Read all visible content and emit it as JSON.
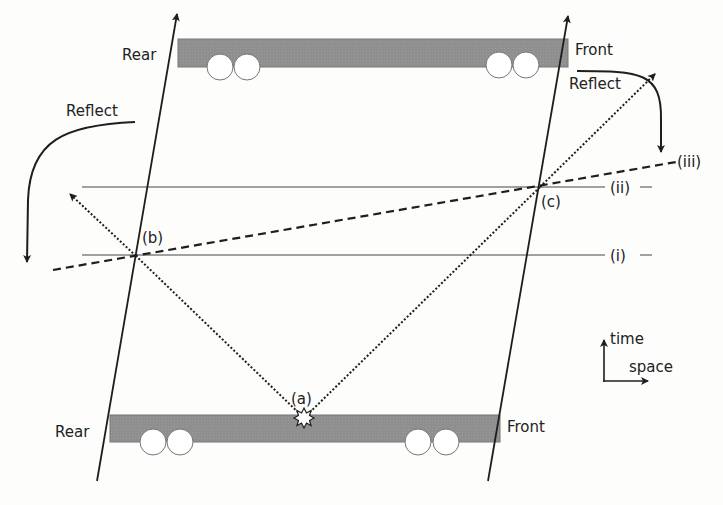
{
  "diagram": {
    "type": "spacetime-diagram",
    "colors": {
      "train_fill": "#8f8f8f",
      "line": "#1e1e1e",
      "background": "#fdfdfc"
    },
    "labels": {
      "rear_top": "Rear",
      "front_top": "Front",
      "rear_bottom": "Rear",
      "front_bottom": "Front",
      "reflect_left": "Reflect",
      "reflect_right": "Reflect",
      "event_a": "(a)",
      "event_b": "(b)",
      "event_c": "(c)",
      "line_i": "(i)",
      "line_ii": "(ii)",
      "line_iii": "(iii)",
      "axis_time": "time",
      "axis_space": "space"
    }
  }
}
